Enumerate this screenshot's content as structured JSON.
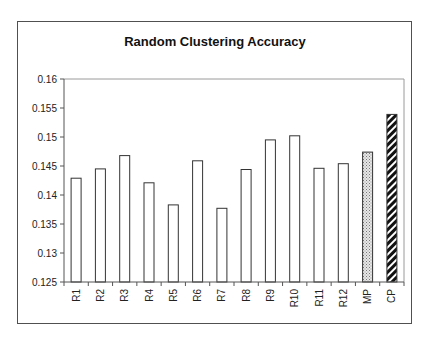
{
  "chart_data": {
    "type": "bar",
    "title": "Random Clustering Accuracy",
    "xlabel": "",
    "ylabel": "",
    "ylim": [
      0.125,
      0.16
    ],
    "yticks": [
      "0.16",
      "0.155",
      "0.15",
      "0.145",
      "0.14",
      "0.135",
      "0.13",
      "0.125"
    ],
    "ytick_values": [
      0.16,
      0.155,
      0.15,
      0.145,
      0.14,
      0.135,
      0.13,
      0.125
    ],
    "grid": false,
    "legend": null,
    "categories": [
      "R1",
      "R2",
      "R3",
      "R4",
      "R5",
      "R6",
      "R7",
      "R8",
      "R9",
      "R10",
      "R11",
      "R12",
      "MP",
      "CP"
    ],
    "values": [
      0.1429,
      0.1445,
      0.1468,
      0.1421,
      0.1383,
      0.1459,
      0.1377,
      0.1444,
      0.1495,
      0.1502,
      0.1446,
      0.1454,
      0.1474,
      0.1539
    ],
    "bar_styles": [
      "hollow",
      "hollow",
      "hollow",
      "hollow",
      "hollow",
      "hollow",
      "hollow",
      "hollow",
      "hollow",
      "hollow",
      "hollow",
      "hollow",
      "dotted",
      "diagonal-stripes"
    ]
  },
  "colors": {
    "bar_outline": "#333333",
    "bar_fill": "#ffffff",
    "dotted_fill": "#c8c8c8",
    "stripe_fill": "#111111",
    "axis": "#555555",
    "plot_border": "#9a9a9a"
  }
}
